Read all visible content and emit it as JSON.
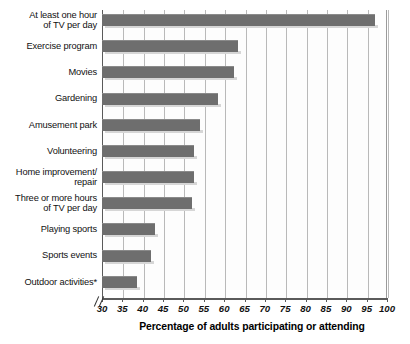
{
  "chart_data": {
    "type": "bar",
    "orientation": "horizontal",
    "title": "",
    "xlabel": "Percentage of adults participating or attending",
    "ylabel": "",
    "xlim": [
      30,
      100
    ],
    "xticks": [
      30,
      35,
      40,
      45,
      50,
      55,
      60,
      65,
      70,
      75,
      80,
      85,
      90,
      95,
      100
    ],
    "axis_break": true,
    "grid": "vertical",
    "legend": "none",
    "bar_color": "#6e6e6e",
    "categories": [
      "At least one hour\nof TV per day",
      "Exercise program",
      "Movies",
      "Gardening",
      "Amusement park",
      "Volunteering",
      "Home improvement/\nrepair",
      "Three or more hours\nof TV per day",
      "Playing sports",
      "Sports events",
      "Outdoor activities*"
    ],
    "values": [
      97,
      63.5,
      62.5,
      58.5,
      54,
      52.5,
      52.5,
      52,
      43,
      42,
      38.5
    ],
    "footnote": "*"
  },
  "axis": {
    "tick_labels": [
      "30",
      "35",
      "40",
      "45",
      "50",
      "55",
      "60",
      "65",
      "70",
      "75",
      "80",
      "85",
      "90",
      "95",
      "100"
    ],
    "x_title": "Percentage of adults participating or attending"
  },
  "categories": [
    {
      "label_line1": "At least one hour",
      "label_line2": "of TV per day"
    },
    {
      "label_line1": "Exercise program",
      "label_line2": ""
    },
    {
      "label_line1": "Movies",
      "label_line2": ""
    },
    {
      "label_line1": "Gardening",
      "label_line2": ""
    },
    {
      "label_line1": "Amusement park",
      "label_line2": ""
    },
    {
      "label_line1": "Volunteering",
      "label_line2": ""
    },
    {
      "label_line1": "Home improvement/",
      "label_line2": "repair"
    },
    {
      "label_line1": "Three or more hours",
      "label_line2": "of TV per day"
    },
    {
      "label_line1": "Playing sports",
      "label_line2": ""
    },
    {
      "label_line1": "Sports events",
      "label_line2": ""
    },
    {
      "label_line1": "Outdoor activities*",
      "label_line2": ""
    }
  ]
}
